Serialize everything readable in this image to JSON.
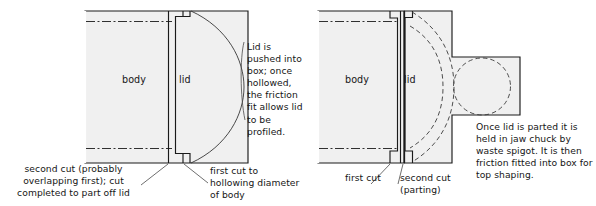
{
  "figure": {
    "type": "technical-woodturning-diagram",
    "background_color": "#ffffff",
    "fill_color": "#f0f0f0",
    "line_color": "#1a1a1a"
  },
  "left_diagram": {
    "name": "lid-pushed-into-box",
    "labels": {
      "body": "body",
      "lid": "lid"
    },
    "note": "Lid is pushed into box; once hollowed, the friction fit allows lid to be profiled.",
    "captions": {
      "second_cut": "second cut (probably overlapping first); cut completed to part off lid",
      "first_cut": "first cut to hollowing diameter of body"
    }
  },
  "right_diagram": {
    "name": "lid-parted-with-waste-spigot",
    "labels": {
      "body": "body",
      "lid": "lid"
    },
    "note": "Once lid is parted it is held in jaw chuck by waste spigot. It is then friction fitted into box for top shaping.",
    "captions": {
      "first_cut": "first cut",
      "second_cut": "second cut (parting)"
    }
  }
}
